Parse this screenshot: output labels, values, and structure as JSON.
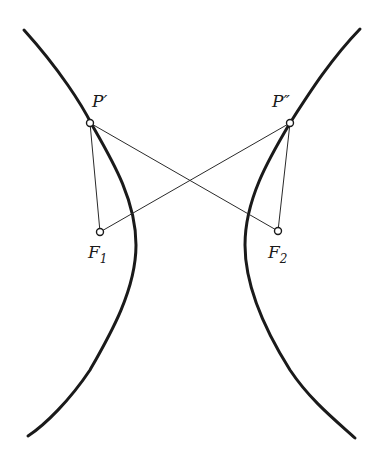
{
  "diagram": {
    "type": "hyperbola-foci",
    "colors": {
      "stroke": "#1a1a1a",
      "background": "#ffffff"
    },
    "branches": [
      {
        "name": "left-branch",
        "top": [
          24,
          30
        ],
        "vertex": [
          135,
          245
        ],
        "bottom": [
          28,
          436
        ]
      },
      {
        "name": "right-branch",
        "top": [
          360,
          29
        ],
        "vertex": [
          245,
          245
        ],
        "bottom": [
          355,
          438
        ]
      }
    ],
    "points": {
      "P1": {
        "label": "P′",
        "x": 90,
        "y": 123
      },
      "P2": {
        "label": "P″",
        "x": 290,
        "y": 123
      },
      "F1": {
        "label": "F",
        "sub": "1",
        "x": 100,
        "y": 232
      },
      "F2": {
        "label": "F",
        "sub": "2",
        "x": 278,
        "y": 231
      }
    },
    "segments": [
      [
        "P1",
        "F1"
      ],
      [
        "P1",
        "F2"
      ],
      [
        "P2",
        "F1"
      ],
      [
        "P2",
        "F2"
      ]
    ]
  }
}
